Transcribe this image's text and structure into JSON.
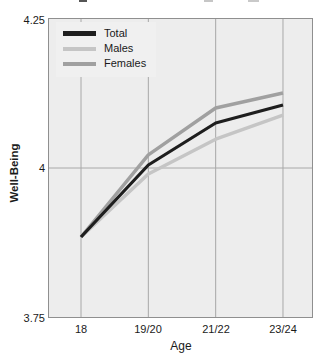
{
  "artifacts": {
    "top_cropped_text_fragments": [
      {
        "x": 79,
        "y": 0,
        "w": 8,
        "h": 2,
        "color": "#555555"
      },
      {
        "x": 204,
        "y": 0,
        "w": 9,
        "h": 2,
        "color": "#c6c6c6"
      },
      {
        "x": 248,
        "y": 0,
        "w": 11,
        "h": 2,
        "color": "#c9c9c9"
      }
    ]
  },
  "chart_data": {
    "type": "line",
    "title": "",
    "xlabel": "Age",
    "ylabel": "Well-Being",
    "x_categories": [
      "18",
      "19/20",
      "21/22",
      "23/24"
    ],
    "ylim": [
      3.75,
      4.25
    ],
    "ytick_labels": [
      "4.25",
      "4",
      "3.75"
    ],
    "ytick_values": [
      4.25,
      4.0,
      3.75
    ],
    "grid": {
      "vertical_at_categories": true,
      "horizontal_at": [
        4.0
      ]
    },
    "legend": {
      "position": "top-left",
      "entries": [
        "Total",
        "Males",
        "Females"
      ]
    },
    "series": [
      {
        "name": "Total",
        "color": "#1e1e1e",
        "width": 3.2,
        "values": [
          3.885,
          4.005,
          4.075,
          4.105
        ]
      },
      {
        "name": "Males",
        "color": "#c5c5c5",
        "width": 3.4,
        "values": [
          3.885,
          3.99,
          4.048,
          4.088
        ]
      },
      {
        "name": "Females",
        "color": "#a0a0a0",
        "width": 3.4,
        "values": [
          3.885,
          4.022,
          4.1,
          4.125
        ]
      }
    ],
    "colors": {
      "plot_bg": "#ededed",
      "legend_bg": "#f0f0f0",
      "grid": "#a8a8a8",
      "border": "#8f8f8f",
      "text": "#1a1a1a"
    }
  }
}
